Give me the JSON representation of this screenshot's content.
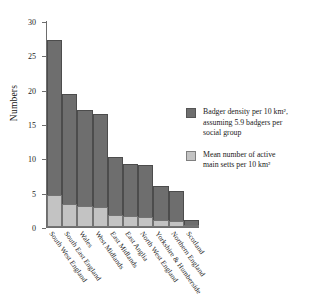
{
  "chart_data": {
    "type": "bar",
    "title": "",
    "subtitle": "",
    "xlabel": "",
    "ylabel": "Numbers",
    "ylim": [
      0,
      30
    ],
    "yticks": [
      0,
      5,
      10,
      15,
      20,
      25,
      30
    ],
    "ytick_labels": [
      "0",
      "5",
      "10",
      "15",
      "20",
      "25",
      "30"
    ],
    "grid": false,
    "stacked": true,
    "legend_position": "right",
    "categories": [
      "South West England",
      "South East England",
      "Wales",
      "West Midlands",
      "East Midlands",
      "East Anglia",
      "North West England",
      "Yorkshire & Humberside",
      "Northern England",
      "Scotland"
    ],
    "series": [
      {
        "name": "Badger density per 10 km², assuming 5.9 badgers per social group",
        "color": "#6e6e6e",
        "values": [
          27.2,
          19.4,
          17.1,
          16.5,
          10.2,
          9.2,
          9.1,
          6.0,
          5.2,
          1.0
        ]
      },
      {
        "name": "Mean number of active main setts per 10 km²",
        "color": "#c3c3c3",
        "values": [
          4.7,
          3.4,
          3.0,
          2.9,
          1.7,
          1.6,
          1.5,
          1.0,
          0.9,
          0.2
        ]
      }
    ]
  },
  "axes": {
    "y_axis_label": "Numbers"
  },
  "legend": {
    "items": [
      {
        "swatch_name": "legend-swatch-density",
        "line1": "Badger density per 10 km²,",
        "line2": "assuming 5.9 badgers per",
        "line3": "social group"
      },
      {
        "swatch_name": "legend-swatch-setts",
        "line1": "Mean number of active",
        "line2": "main setts per 10 km²",
        "line3": ""
      }
    ]
  },
  "colors": {
    "density": "#6e6e6e",
    "setts": "#c3c3c3",
    "axis": "#6d6d6d",
    "text": "#1b1b1b",
    "background": "#ffffff"
  }
}
